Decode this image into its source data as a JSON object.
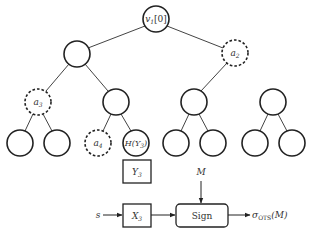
{
  "diagram": {
    "tree": {
      "root": {
        "label": "v",
        "subscript": "1",
        "suffix": "[0]"
      },
      "level1": [
        {
          "label": "",
          "style": "solid"
        },
        {
          "label": "a",
          "subscript": "2",
          "style": "dashed"
        }
      ],
      "level2": [
        {
          "label": "a",
          "subscript": "3",
          "style": "dashed"
        },
        {
          "label": "",
          "style": "solid"
        },
        {
          "label": "",
          "style": "solid"
        },
        {
          "label": "",
          "style": "solid"
        }
      ],
      "leaves": [
        {
          "label": "",
          "style": "solid"
        },
        {
          "label": "",
          "style": "solid"
        },
        {
          "label": "a",
          "subscript": "4",
          "style": "dashed"
        },
        {
          "label": "H(Y",
          "subscript": "3",
          "suffix": ")",
          "style": "solid"
        },
        {
          "label": "",
          "style": "solid"
        },
        {
          "label": "",
          "style": "solid"
        },
        {
          "label": "",
          "style": "solid"
        },
        {
          "label": "",
          "style": "solid"
        }
      ]
    },
    "boxes": {
      "y3": {
        "label": "Y",
        "subscript": "3"
      },
      "x3": {
        "label": "X",
        "subscript": "3"
      },
      "sign": {
        "label": "Sign"
      }
    },
    "inputs": {
      "s": "s",
      "m": "M"
    },
    "output": {
      "label": "σ",
      "subscript": "OTS",
      "suffix": "(M)"
    }
  }
}
